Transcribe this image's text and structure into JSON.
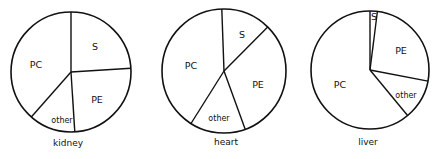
{
  "chart_data": [
    {
      "type": "pie",
      "title": "kidney",
      "start_angle_deg": 0,
      "direction": "clockwise",
      "slices": [
        {
          "label": "S",
          "value": 24
        },
        {
          "label": "PE",
          "value": 25
        },
        {
          "label": "other",
          "value": 12.5
        },
        {
          "label": "PC",
          "value": 38.5
        }
      ]
    },
    {
      "type": "pie",
      "title": "heart",
      "start_angle_deg": -2,
      "direction": "clockwise",
      "slices": [
        {
          "label": "S",
          "value": 13
        },
        {
          "label": "PE",
          "value": 32
        },
        {
          "label": "other",
          "value": 14.5
        },
        {
          "label": "PC",
          "value": 40.5
        }
      ]
    },
    {
      "type": "pie",
      "title": "liver",
      "start_angle_deg": 0,
      "direction": "clockwise",
      "slices": [
        {
          "label": "S",
          "value": 2
        },
        {
          "label": "PE",
          "value": 26
        },
        {
          "label": "other",
          "value": 11
        },
        {
          "label": "PC",
          "value": 61
        }
      ]
    }
  ],
  "layout": {
    "pies": [
      {
        "cx": 71,
        "cy": 72,
        "r": 60,
        "caption_x": 68,
        "caption_y": 138,
        "label_pos": {
          "S": [
            95,
            47
          ],
          "PE": [
            97,
            100
          ],
          "other": [
            62,
            120
          ],
          "PC": [
            36,
            65
          ]
        }
      },
      {
        "cx": 224,
        "cy": 71,
        "r": 62,
        "caption_x": 226,
        "caption_y": 137,
        "label_pos": {
          "S": [
            242,
            35
          ],
          "PE": [
            258,
            85
          ],
          "other": [
            219,
            118
          ],
          "PC": [
            191,
            66
          ]
        }
      },
      {
        "cx": 370,
        "cy": 70,
        "r": 59,
        "caption_x": 368,
        "caption_y": 137,
        "label_pos": {
          "S": [
            374,
            17
          ],
          "PE": [
            401,
            51
          ],
          "other": [
            406,
            95
          ],
          "PC": [
            340,
            85
          ]
        }
      }
    ]
  }
}
